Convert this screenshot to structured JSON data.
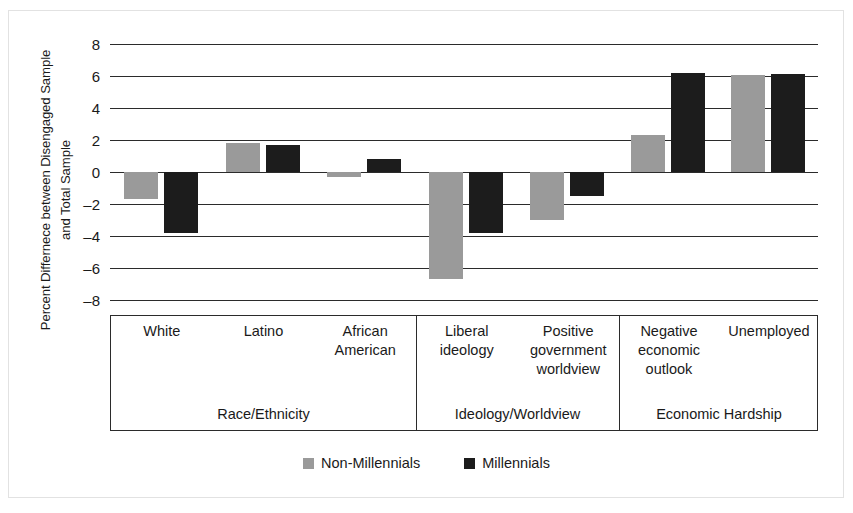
{
  "chart_data": {
    "type": "bar",
    "title": "",
    "subtitle": "",
    "xlabel": "",
    "ylabel": "Percent Differnece between Disengaged Sample and Total Sample",
    "ylim": [
      -8,
      8
    ],
    "yticks": [
      8,
      6,
      4,
      2,
      0,
      -2,
      -4,
      -6,
      -8
    ],
    "ytick_labels": [
      "8",
      "6",
      "4",
      "2",
      "0",
      "–2",
      "–4",
      "–6",
      "–8"
    ],
    "grid": true,
    "legend_position": "bottom",
    "categories": [
      "White",
      "Latino",
      "African American",
      "Liberal ideology",
      "Positive government worldview",
      "Negative economic outlook",
      "Unemployed"
    ],
    "category_lines": [
      [
        "White"
      ],
      [
        "Latino"
      ],
      [
        "African",
        "American"
      ],
      [
        "Liberal",
        "ideology"
      ],
      [
        "Positive",
        "government",
        "worldview"
      ],
      [
        "Negative",
        "economic",
        "outlook"
      ],
      [
        "Unemployed"
      ]
    ],
    "groups": [
      {
        "label": "Race/Ethnicity",
        "categories": [
          "White",
          "Latino",
          "African American"
        ]
      },
      {
        "label": "Ideology/Worldview",
        "categories": [
          "Liberal ideology",
          "Positive government worldview"
        ]
      },
      {
        "label": "Economic Hardship",
        "categories": [
          "Negative economic outlook",
          "Unemployed"
        ]
      }
    ],
    "series": [
      {
        "name": "Non-Millennials",
        "color": "#9a9a9a",
        "values": [
          -1.7,
          1.8,
          -0.3,
          -6.7,
          -3.0,
          2.3,
          6.05
        ]
      },
      {
        "name": "Millennials",
        "color": "#1c1c1c",
        "values": [
          -3.8,
          1.7,
          0.8,
          -3.8,
          -1.5,
          6.2,
          6.1
        ]
      }
    ]
  },
  "legend": {
    "items": [
      {
        "label": "Non-Millennials",
        "swatch": "gray"
      },
      {
        "label": "Millennials",
        "swatch": "black"
      }
    ]
  }
}
